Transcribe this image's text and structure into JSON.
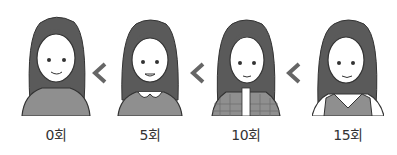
{
  "illustration": {
    "figures": [
      {
        "label": "0회",
        "outfit": "plain-sweater"
      },
      {
        "label": "5회",
        "outfit": "peter-pan-collar-sweater"
      },
      {
        "label": "10회",
        "outfit": "plaid-jacket"
      },
      {
        "label": "15회",
        "outfit": "v-neck-vest"
      }
    ],
    "separator": "<",
    "colors": {
      "hair": "#5a5a5a",
      "skin": "#ffffff",
      "clothes": "#8f8f8f",
      "line": "#333333",
      "chevron": "#666666"
    }
  }
}
